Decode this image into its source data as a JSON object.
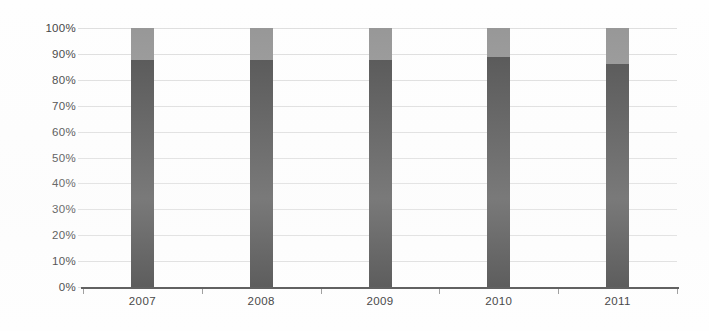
{
  "chart_data": {
    "type": "bar",
    "subtype": "stacked-column-100",
    "title": "",
    "subtitle": "",
    "xlabel": "",
    "ylabel": "",
    "categories": [
      "2007",
      "2008",
      "2009",
      "2010",
      "2011"
    ],
    "ylim": [
      0,
      100
    ],
    "ytick_labels": [
      "0%",
      "10%",
      "20%",
      "30%",
      "40%",
      "50%",
      "60%",
      "70%",
      "80%",
      "90%",
      "100%"
    ],
    "ytick_values": [
      0,
      10,
      20,
      30,
      40,
      50,
      60,
      70,
      80,
      90,
      100
    ],
    "grid": true,
    "grid_axis": "y",
    "legend": false,
    "legend_position": "none",
    "series": [
      {
        "name": "Series 1",
        "color": "#4f4f4f",
        "values": [
          87.5,
          87.5,
          87.5,
          89.0,
          86.0
        ]
      },
      {
        "name": "Series 2",
        "color": "#949494",
        "values": [
          12.5,
          12.5,
          12.5,
          11.0,
          14.0
        ]
      }
    ],
    "annotations": []
  },
  "colors": {
    "background": "#fefefe",
    "gridline": "#dedede",
    "axis": "#545454",
    "tick": "#9a9a9a",
    "text": "#3d3d3d",
    "series_dark": "#4f4f4f",
    "series_light": "#949494"
  }
}
